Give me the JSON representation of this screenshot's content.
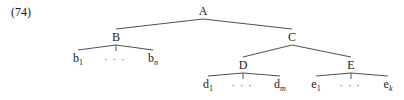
{
  "example_number": "(74)",
  "tree": {
    "root": "A",
    "nodes": [
      {
        "id": "A",
        "label": "A",
        "parent": null
      },
      {
        "id": "B",
        "label": "B",
        "parent": "A"
      },
      {
        "id": "C",
        "label": "C",
        "parent": "A"
      },
      {
        "id": "b1",
        "label": "b",
        "subscript": "1",
        "subscript_italic": false,
        "parent": "B"
      },
      {
        "id": "bdots",
        "label": "…",
        "parent": "B"
      },
      {
        "id": "bn",
        "label": "b",
        "subscript": "n",
        "subscript_italic": true,
        "parent": "B"
      },
      {
        "id": "D",
        "label": "D",
        "parent": "C"
      },
      {
        "id": "E",
        "label": "E",
        "parent": "C"
      },
      {
        "id": "d1",
        "label": "d",
        "subscript": "1",
        "subscript_italic": false,
        "parent": "D"
      },
      {
        "id": "ddots",
        "label": "…",
        "parent": "D"
      },
      {
        "id": "dm",
        "label": "d",
        "subscript": "m",
        "subscript_italic": true,
        "parent": "D"
      },
      {
        "id": "e1",
        "label": "e",
        "subscript": "1",
        "subscript_italic": false,
        "parent": "E"
      },
      {
        "id": "edots",
        "label": "…",
        "parent": "E"
      },
      {
        "id": "ek",
        "label": "e",
        "subscript": "k",
        "subscript_italic": true,
        "parent": "E"
      }
    ]
  }
}
